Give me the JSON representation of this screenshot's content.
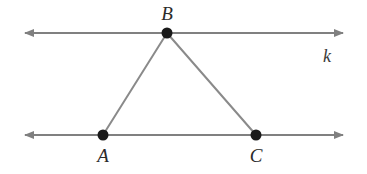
{
  "figure": {
    "type": "geometry-diagram",
    "background_color": "#ffffff",
    "width": 367,
    "height": 174
  },
  "colors": {
    "line_gray": "#808080",
    "triangle_gray": "#8a8a8a",
    "point_black": "#1a1a1a",
    "label_dark": "#2b2b2b",
    "label_line": "#3a3a3a",
    "background": "#ffffff"
  },
  "lines": {
    "top": {
      "name": "k",
      "label": "k",
      "label_x": 327,
      "label_y": 62,
      "y": 33,
      "x_start": 25,
      "x_end": 343,
      "stroke_width": 2,
      "arrow_left": true,
      "arrow_right": true
    },
    "bottom": {
      "name": "",
      "label": "",
      "y": 135,
      "x_start": 25,
      "x_end": 343,
      "stroke_width": 2,
      "arrow_left": true,
      "arrow_right": true
    }
  },
  "points": [
    {
      "id": "B",
      "label": "B",
      "x": 167,
      "y": 33,
      "radius": 5.5,
      "label_x": 167,
      "label_y": 20
    },
    {
      "id": "A",
      "label": "A",
      "x": 103,
      "y": 135,
      "radius": 5.5,
      "label_x": 103,
      "label_y": 162
    },
    {
      "id": "C",
      "label": "C",
      "x": 256,
      "y": 135,
      "radius": 5.5,
      "label_x": 256,
      "label_y": 162
    }
  ],
  "segments": [
    {
      "id": "AB",
      "x1": 103,
      "y1": 135,
      "x2": 167,
      "y2": 33,
      "stroke_width": 2
    },
    {
      "id": "BC",
      "x1": 167,
      "y1": 33,
      "x2": 256,
      "y2": 135,
      "stroke_width": 2
    }
  ]
}
